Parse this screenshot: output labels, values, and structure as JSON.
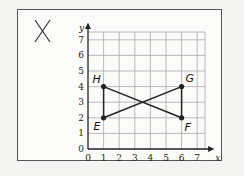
{
  "title_mark": "X",
  "chart_data": {
    "type": "scatter",
    "title": "",
    "xlabel": "x",
    "ylabel": "y",
    "xlim": [
      0,
      7
    ],
    "ylim": [
      0,
      7
    ],
    "x_ticks": [
      "0",
      "1",
      "2",
      "3",
      "4",
      "5",
      "6",
      "7"
    ],
    "y_ticks": [
      "0",
      "1",
      "2",
      "3",
      "4",
      "5",
      "6",
      "7"
    ],
    "grid": true,
    "points": [
      {
        "label": "H",
        "x": 1,
        "y": 4
      },
      {
        "label": "E",
        "x": 1,
        "y": 2
      },
      {
        "label": "G",
        "x": 6,
        "y": 4
      },
      {
        "label": "F",
        "x": 6,
        "y": 2
      }
    ],
    "segments": [
      [
        "H",
        "E"
      ],
      [
        "H",
        "F"
      ],
      [
        "E",
        "G"
      ],
      [
        "G",
        "F"
      ]
    ]
  },
  "colors": {
    "grid": "#a8a8a8",
    "axis": "#222222",
    "line": "#222222",
    "frame": "#555555"
  }
}
